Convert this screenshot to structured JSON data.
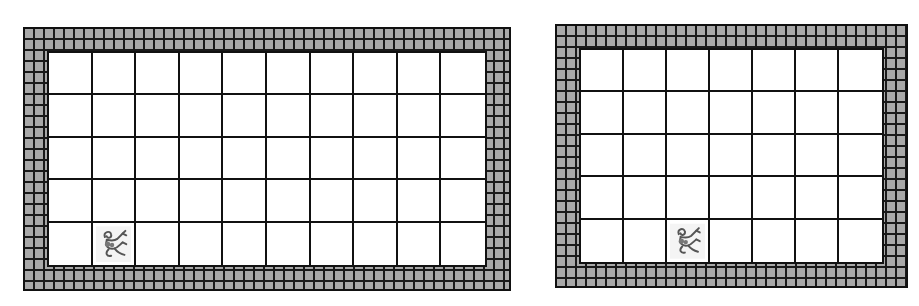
{
  "colors": {
    "brick": "#a9a9a9",
    "mortar": "#1a1a1a",
    "floor": "#ffffff",
    "grid_line": "#111111"
  },
  "worlds": [
    {
      "id": "left-world",
      "cols": 10,
      "rows": 5,
      "walls": [
        [
          1,
          5
        ],
        [
          2,
          4
        ],
        [
          2,
          5
        ],
        [
          2,
          6
        ],
        [
          3,
          3
        ],
        [
          3,
          4
        ],
        [
          3,
          5
        ],
        [
          3,
          6
        ],
        [
          3,
          7
        ],
        [
          4,
          2
        ],
        [
          4,
          3
        ],
        [
          4,
          4
        ],
        [
          4,
          5
        ],
        [
          4,
          6
        ],
        [
          4,
          7
        ],
        [
          4,
          8
        ]
      ],
      "robot": {
        "row": 4,
        "col": 1,
        "icon": "creature-icon"
      },
      "box": {
        "x": 23,
        "y": 27,
        "w": 488,
        "h": 264
      },
      "border": 24
    },
    {
      "id": "right-world",
      "cols": 7,
      "rows": 5,
      "walls": [
        [
          3,
          4
        ],
        [
          4,
          3
        ],
        [
          4,
          4
        ],
        [
          4,
          5
        ]
      ],
      "robot": {
        "row": 4,
        "col": 2,
        "icon": "creature-icon"
      },
      "box": {
        "x": 555,
        "y": 24,
        "w": 353,
        "h": 264
      },
      "border": 24
    }
  ]
}
